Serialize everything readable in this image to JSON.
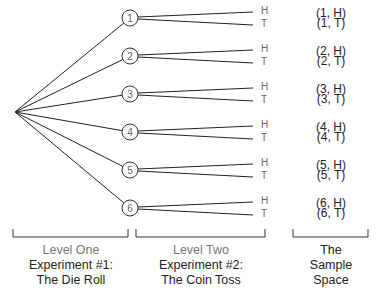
{
  "tree": {
    "root": {
      "x": 15,
      "y": 112
    },
    "die_nodes": [
      {
        "label": "1",
        "x": 130,
        "y": 18
      },
      {
        "label": "2",
        "x": 130,
        "y": 56
      },
      {
        "label": "3",
        "x": 130,
        "y": 94
      },
      {
        "label": "4",
        "x": 130,
        "y": 132
      },
      {
        "label": "5",
        "x": 130,
        "y": 170
      },
      {
        "label": "6",
        "x": 130,
        "y": 208
      }
    ],
    "coin_labels": [
      "H",
      "T"
    ]
  },
  "outcomes": [
    "(1, H)",
    "(1, T)",
    "(2, H)",
    "(2, T)",
    "(3, H)",
    "(3, T)",
    "(4, H)",
    "(4, T)",
    "(5, H)",
    "(5, T)",
    "(6, H)",
    "(6, T)"
  ],
  "captions": {
    "level_one": {
      "level": "Level One",
      "line1": "Experiment #1:",
      "line2": "The Die Roll"
    },
    "level_two": {
      "level": "Level Two",
      "line1": "Experiment #2:",
      "line2": "The Coin Toss"
    },
    "sample_space": {
      "line1": "The",
      "line2": "Sample",
      "line3": "Space"
    }
  }
}
